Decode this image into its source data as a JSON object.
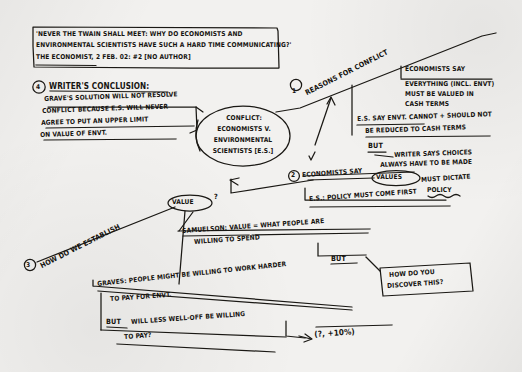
{
  "page": {
    "kind": "hand-drawn concept map / mind map on paper",
    "ink_color": "#1a1814",
    "paper_color": "#f2f1ef"
  },
  "source_box": {
    "line1": "'NEVER THE TWAIN SHALL MEET: WHY DO ECONOMISTS AND",
    "line2": "ENVIRONMENTAL SCIENTISTS HAVE SUCH A HARD TIME COMMUNICATING?'",
    "line3": "THE ECONOMIST, 2 FEB. 02: #2 [NO AUTHOR]"
  },
  "center_node": {
    "line1": "CONFLICT:",
    "line2": "ECONOMISTS V.",
    "line3": "ENVIRONMENTAL",
    "line4": "SCIENTISTS [E.S.]"
  },
  "branches": {
    "conclusion": {
      "marker": "4",
      "heading": "WRITER'S CONCLUSION:",
      "line1": "GRAVE'S SOLUTION WILL NOT RESOLVE",
      "line2": "CONFLICT BECAUSE E.S. WILL NEVER",
      "line3": "AGREE TO PUT AN UPPER LIMIT",
      "line4": "ON VALUE OF ENVT."
    },
    "reasons": {
      "marker": "1",
      "label": "REASONS FOR CONFLICT"
    },
    "economists_cash": {
      "line1": "ECONOMISTS SAY",
      "line2": "EVERYTHING (INCL. ENVT)",
      "line3": "MUST BE VALUED IN",
      "line4": "CASH TERMS"
    },
    "es_reply": {
      "line1": "E.S. SAY ENVT. CANNOT + SHOULD NOT",
      "line2": "BE REDUCED TO CASH TERMS",
      "but": "BUT",
      "line3": "WRITER SAYS CHOICES",
      "line4": "ALWAYS HAVE TO BE MADE"
    },
    "values_policy": {
      "marker": "2",
      "pre": "ECONOMISTS SAY",
      "circled": "VALUES",
      "post": "MUST DICTATE",
      "post2": "POLICY",
      "es_line": "E.S.: POLICY MUST COME FIRST"
    },
    "establish_value": {
      "marker": "3",
      "pre": "HOW DO WE ESTABLISH",
      "circled": "VALUE",
      "post": "?"
    },
    "samuelson": {
      "line1": "SAMUELSON: VALUE = WHAT PEOPLE ARE",
      "line2": "WILLING TO SPEND",
      "but": "BUT"
    },
    "discover_box": {
      "line1": "HOW DO YOU",
      "line2": "DISCOVER THIS?"
    },
    "graves": {
      "line1": "GRAVES: PEOPLE MIGHT BE WILLING TO WORK HARDER",
      "line2": "TO PAY FOR ENVT.",
      "but": "BUT",
      "line3": "WILL LESS WELL-OFF BE WILLING",
      "line4": "TO PAY?",
      "annotation": "(?, +10%)"
    }
  }
}
